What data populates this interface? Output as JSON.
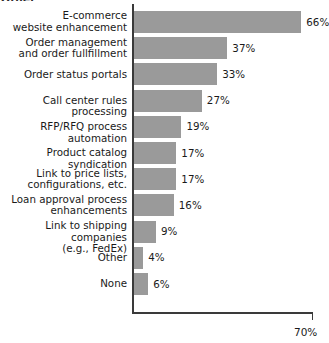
{
  "top_fragment": "Other",
  "chart_data": {
    "type": "bar",
    "orientation": "horizontal",
    "title": "",
    "xlabel": "",
    "ylabel": "",
    "xlim": [
      0,
      70
    ],
    "grid": false,
    "legend": null,
    "axis_end_label": "70%",
    "bar_color": "#9a9a9a",
    "axis_color": "#3a3a3a",
    "categories": [
      "E-commerce\nwebsite enhancement",
      "Order management\nand order fullfillment",
      "Order status portals",
      "Call center rules processing",
      "RFP/RFQ process automation",
      "Product catalog syndication",
      "Link to price lists,\nconfigurations, etc.",
      "Loan approval process\nenhancements",
      "Link to shipping companies\n(e.g., FedEx)",
      "Other",
      "None"
    ],
    "values": [
      66,
      37,
      33,
      27,
      19,
      17,
      17,
      16,
      9,
      4,
      6
    ],
    "value_labels": [
      "66%",
      "37%",
      "33%",
      "27%",
      "19%",
      "17%",
      "17%",
      "16%",
      "9%",
      "4%",
      "6%"
    ]
  }
}
